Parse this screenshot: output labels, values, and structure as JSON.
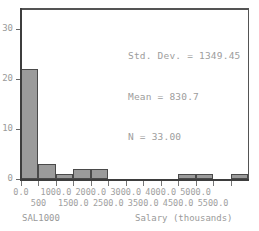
{
  "chart_data": {
    "type": "bar",
    "subtype": "histogram",
    "title": "",
    "xlabel": "Salary (thousands)",
    "ylabel": "",
    "variable_label": "SAL1000",
    "bin_width": 500,
    "categories": [
      "0.0",
      "500",
      "1000.0",
      "1500.0",
      "2000.0",
      "2500.0",
      "3000.0",
      "3500.0",
      "4000.0",
      "4500.0",
      "5000.0",
      "5500.0",
      "6000.0"
    ],
    "bin_centers": [
      250,
      750,
      1250,
      1750,
      2250,
      2750,
      3250,
      3750,
      4250,
      4750,
      5250,
      5750,
      6250
    ],
    "values": [
      22,
      3,
      1,
      2,
      2,
      0,
      0,
      0,
      0,
      1,
      1,
      0,
      1
    ],
    "xlim": [
      0,
      6500
    ],
    "ylim": [
      0,
      34
    ],
    "yticks": [
      "0",
      "10",
      "20",
      "30"
    ],
    "ytick_values": [
      0,
      10,
      20,
      30
    ],
    "xticks_upper": [
      "0.0",
      "1000.0",
      "2000.0",
      "3000.0",
      "4000.0",
      "5000.0"
    ],
    "xticks_upper_values": [
      0,
      1000,
      2000,
      3000,
      4000,
      5000
    ],
    "xticks_lower": [
      "500",
      "1500.0",
      "2500.0",
      "3500.0",
      "4500.0",
      "5500.0"
    ],
    "xticks_lower_values": [
      500,
      1500,
      2500,
      3500,
      4500,
      5500
    ],
    "grid": false,
    "legend": false,
    "bar_fill_color": "#9b9b9b",
    "bar_border_color": "#4a4a4a",
    "axis_color": "#3d3d3d",
    "text_color": "#9a9a9a",
    "background_color": "#ffffff",
    "annotations": [
      "Std. Dev. = 1349.45",
      "Mean = 830.7",
      "N = 33.00"
    ]
  },
  "statistics": {
    "std_dev_line": "Std. Dev. = 1349.45",
    "mean_line": "Mean = 830.7",
    "n_line": "N = 33.00",
    "std_dev": "1349.45",
    "mean": "830.7",
    "n": "33.00"
  },
  "labels": {
    "variable": "SAL1000",
    "x_axis_title": "Salary (thousands)",
    "title_fragment": ""
  }
}
